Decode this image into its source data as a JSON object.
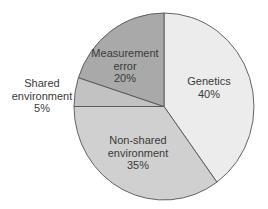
{
  "chart_data": {
    "type": "pie",
    "title": "",
    "start_angle_deg": 0,
    "direction": "clockwise",
    "slices": [
      {
        "label": "Genetics",
        "value": 40,
        "value_label": "40%",
        "color": "#ececec",
        "label_lines": [
          "Genetics",
          "40%"
        ],
        "label_pos": [
          209,
          85
        ],
        "label_outside": false
      },
      {
        "label": "Non-shared environment",
        "value": 35,
        "value_label": "35%",
        "color": "#d0d0d0",
        "label_lines": [
          "Non-shared",
          "environment",
          "35%"
        ],
        "label_pos": [
          138,
          144
        ],
        "label_outside": false
      },
      {
        "label": "Shared environment",
        "value": 5,
        "value_label": "5%",
        "color": "#c2c2c2",
        "label_lines": [
          "Shared",
          "environment",
          "5%"
        ],
        "label_pos": [
          42,
          87
        ],
        "label_outside": true
      },
      {
        "label": "Measurement error",
        "value": 20,
        "value_label": "20%",
        "color": "#a9a9a9",
        "label_lines": [
          "Measurement",
          "error",
          "20%"
        ],
        "label_pos": [
          125,
          57
        ],
        "label_outside": false
      }
    ],
    "geometry": {
      "cx": 164,
      "cy": 106.5,
      "rx": 90,
      "ry": 93.5
    },
    "stroke_color": "#555555",
    "legend": "none"
  }
}
